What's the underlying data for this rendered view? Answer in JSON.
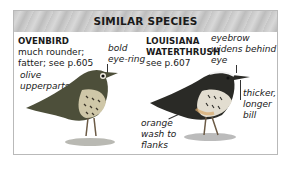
{
  "panel": {
    "title": "SIMILAR SPECIES",
    "species": [
      {
        "name": "OVENBIRD",
        "description_lines": [
          "much rounder;",
          "fatter; see p.605"
        ],
        "annotations": [
          {
            "lines": [
              "bold",
              "eye-ring"
            ]
          },
          {
            "lines": [
              "olive",
              "upperparts"
            ]
          }
        ]
      },
      {
        "name_lines": [
          "LOUISIANA",
          "WATERTHRUSH"
        ],
        "description_lines": [
          "see p.607"
        ],
        "annotations": [
          {
            "lines": [
              "eyebrow",
              "widens behind",
              "eye"
            ]
          },
          {
            "lines": [
              "thicker,",
              "longer",
              "bill"
            ]
          },
          {
            "lines": [
              "orange",
              "wash to",
              "flanks"
            ]
          }
        ]
      }
    ]
  }
}
